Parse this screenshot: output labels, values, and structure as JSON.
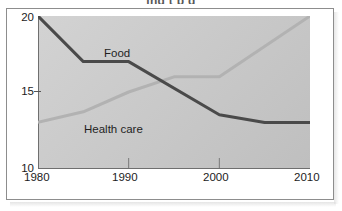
{
  "figure": {
    "clipped_heading": "ing      t    p   g",
    "background_color": "#ffffff",
    "frame_color": "#8d8d8d",
    "plot_fill": "#c9c9c9"
  },
  "chart_data": {
    "type": "line",
    "title": "",
    "subtitle": "",
    "xlabel": "",
    "ylabel": "",
    "xlim": [
      1980,
      2010
    ],
    "ylim": [
      10,
      20
    ],
    "grid": false,
    "legend_position": "inline-annotations",
    "x_ticks": [
      "1980",
      "1990",
      "2000",
      "2010"
    ],
    "x_tick_values": [
      1980,
      1990,
      2000,
      2010
    ],
    "y_ticks": [
      "10",
      "15",
      "20"
    ],
    "y_tick_values": [
      10,
      15,
      20
    ],
    "series": [
      {
        "name": "Food",
        "color": "#4a4a4a",
        "line_width": 3,
        "x": [
          1980,
          1985,
          1990,
          2000,
          2005,
          2010
        ],
        "values": [
          20,
          17,
          17,
          13.5,
          13,
          13
        ]
      },
      {
        "name": "Health care",
        "color": "#b2b2b2",
        "line_width": 3,
        "x": [
          1980,
          1985,
          1990,
          1995,
          2000,
          2010
        ],
        "values": [
          13,
          13.7,
          15,
          16,
          16,
          20
        ]
      }
    ],
    "annotations": [
      {
        "text": "Food",
        "series": "Food"
      },
      {
        "text": "Health care",
        "series": "Health care"
      }
    ]
  },
  "axis": {
    "y": {
      "top_label": "20",
      "mid_label": "15",
      "bottom_label": "10"
    },
    "x": {
      "t1980": "1980",
      "t1990": "1990",
      "t2000": "2000",
      "t2010": "2010"
    }
  }
}
